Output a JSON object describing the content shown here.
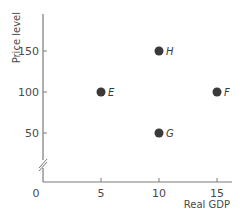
{
  "chart_data": {
    "type": "scatter",
    "title": "",
    "xlabel": "Real GDP",
    "ylabel": "Price level",
    "xlim": [
      0,
      17
    ],
    "ylim": [
      0,
      175
    ],
    "y_axis_break": true,
    "grid": false,
    "legend": "none",
    "x_ticks": [
      {
        "value": 0,
        "label": "0"
      },
      {
        "value": 5,
        "label": "5"
      },
      {
        "value": 10,
        "label": "10"
      },
      {
        "value": 15,
        "label": "15"
      }
    ],
    "y_ticks": [
      {
        "value": 50,
        "label": "50"
      },
      {
        "value": 100,
        "label": "100"
      },
      {
        "value": 150,
        "label": "150"
      }
    ],
    "points": [
      {
        "label": "E",
        "x": 5,
        "y": 100
      },
      {
        "label": "F",
        "x": 15,
        "y": 100
      },
      {
        "label": "G",
        "x": 10,
        "y": 50
      },
      {
        "label": "H",
        "x": 10,
        "y": 150
      }
    ],
    "colors": {
      "axis": "#7a7a7a",
      "point": "#3a3a3a"
    }
  }
}
